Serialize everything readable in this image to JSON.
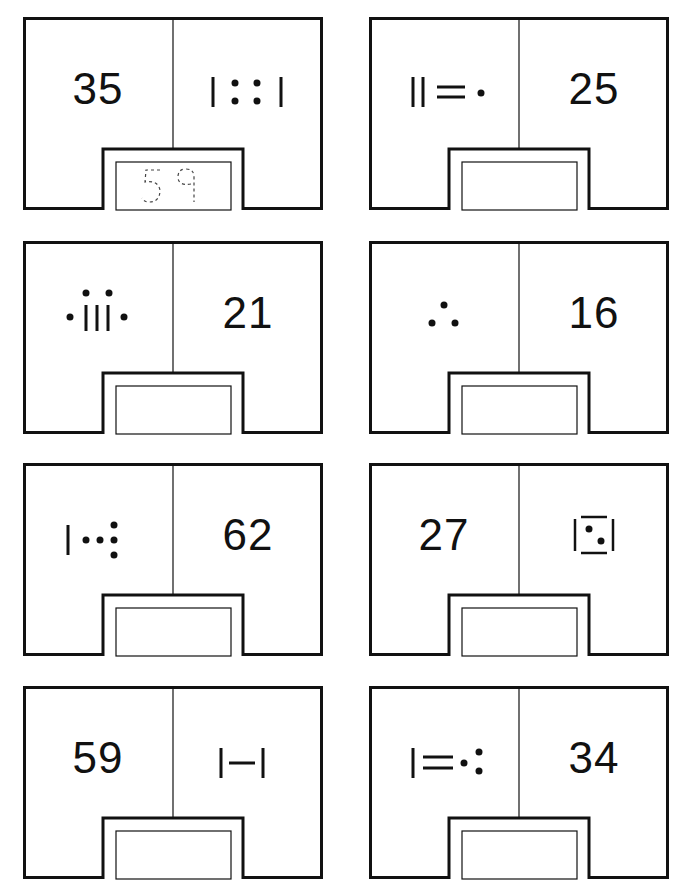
{
  "worksheet": {
    "notation_legend": {
      "bar": 5,
      "dot": 1
    },
    "cards": [
      {
        "id": 1,
        "left": {
          "type": "number",
          "value": "35"
        },
        "right": {
          "type": "glyph",
          "glyph": "bar-4dots-bar"
        },
        "answer": "59",
        "answer_style": "dashed-trace"
      },
      {
        "id": 2,
        "left": {
          "type": "glyph",
          "glyph": "2bars-2hbars-dot"
        },
        "right": {
          "type": "number",
          "value": "25"
        },
        "answer": ""
      },
      {
        "id": 3,
        "left": {
          "type": "glyph",
          "glyph": "dot-3bars-2dots-dot"
        },
        "right": {
          "type": "number",
          "value": "21"
        },
        "answer": ""
      },
      {
        "id": 4,
        "left": {
          "type": "glyph",
          "glyph": "3dots-triangle"
        },
        "right": {
          "type": "number",
          "value": "16"
        },
        "answer": ""
      },
      {
        "id": 5,
        "left": {
          "type": "glyph",
          "glyph": "bar-2dots-3dots-vertical"
        },
        "right": {
          "type": "number",
          "value": "62"
        },
        "answer": ""
      },
      {
        "id": 6,
        "left": {
          "type": "number",
          "value": "27"
        },
        "right": {
          "type": "glyph",
          "glyph": "box-2dots"
        },
        "answer": ""
      },
      {
        "id": 7,
        "left": {
          "type": "number",
          "value": "59"
        },
        "right": {
          "type": "glyph",
          "glyph": "bar-hbar-bar"
        },
        "answer": ""
      },
      {
        "id": 8,
        "left": {
          "type": "glyph",
          "glyph": "bar-2hbars-dot-2dots"
        },
        "right": {
          "type": "number",
          "value": "34"
        },
        "answer": ""
      }
    ]
  },
  "colors": {
    "ink": "#111111",
    "paper": "#ffffff",
    "trace": "#444444"
  }
}
